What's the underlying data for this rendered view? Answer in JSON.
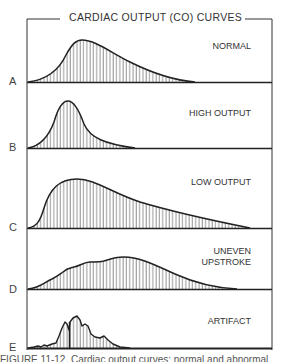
{
  "title": "CARDIAC OUTPUT (CO) CURVES",
  "panels": [
    {
      "letter": "A",
      "label": "NORMAL"
    },
    {
      "letter": "B",
      "label": "HIGH OUTPUT"
    },
    {
      "letter": "C",
      "label": "LOW OUTPUT"
    },
    {
      "letter": "D",
      "label": "UNEVEN\nUPSTROKE"
    },
    {
      "letter": "E",
      "label": "ARTIFACT"
    }
  ],
  "caption": "FIGURE 11-12. Cardiac output curves: normal and abnormal"
}
